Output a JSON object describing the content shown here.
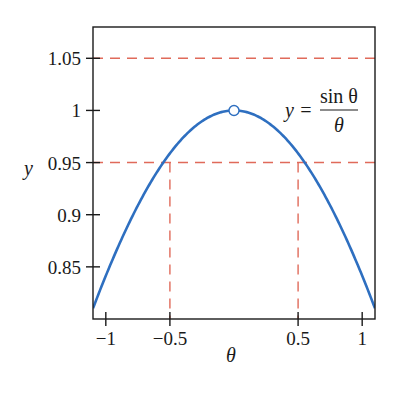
{
  "chart_data": {
    "type": "line",
    "title": "",
    "xlabel": "θ",
    "ylabel": "y",
    "xlim": [
      -1.1,
      1.1
    ],
    "ylim": [
      0.8,
      1.08
    ],
    "grid": false,
    "legend": null,
    "xticks": [
      -1,
      -0.5,
      0.5,
      1
    ],
    "xtick_labels": [
      "−1",
      "−0.5",
      "0.5",
      "1"
    ],
    "yticks": [
      0.85,
      0.9,
      0.95,
      1,
      1.05
    ],
    "ytick_labels": [
      "0.85",
      "0.9",
      "0.95",
      "1",
      "1.05"
    ],
    "series": [
      {
        "name": "y = sin θ / θ",
        "function": "sin(theta)/theta",
        "color": "#2e6fc0",
        "x": [
          -1.1,
          -1.0,
          -0.9,
          -0.8,
          -0.7,
          -0.6,
          -0.5,
          -0.4,
          -0.3,
          -0.2,
          -0.1,
          0.0,
          0.1,
          0.2,
          0.3,
          0.4,
          0.5,
          0.6,
          0.7,
          0.8,
          0.9,
          1.0,
          1.1
        ],
        "values": [
          0.8102,
          0.8415,
          0.8704,
          0.8967,
          0.9203,
          0.9411,
          0.9589,
          0.9736,
          0.9851,
          0.9933,
          0.9983,
          1.0,
          0.9983,
          0.9933,
          0.9851,
          0.9736,
          0.9589,
          0.9411,
          0.9203,
          0.8967,
          0.8704,
          0.8415,
          0.8102
        ]
      }
    ],
    "reference_lines": {
      "color": "#e06a5a",
      "style": "dashed",
      "horizontal": [
        1.05,
        0.95
      ],
      "vertical": [
        {
          "x": -0.5,
          "from_y": 0.8,
          "to_y": 0.95
        },
        {
          "x": 0.5,
          "from_y": 0.8,
          "to_y": 0.95
        }
      ]
    },
    "annotations": [
      {
        "type": "open-circle",
        "x": 0,
        "y": 1,
        "note": "hole at θ = 0 (undefined)"
      },
      {
        "type": "text",
        "text": "y = sin θ / θ",
        "position": "upper right"
      }
    ]
  },
  "labels": {
    "x_axis": "θ",
    "y_axis": "y",
    "formula_lhs": "y =",
    "formula_num": "sin θ",
    "formula_den": "θ"
  }
}
